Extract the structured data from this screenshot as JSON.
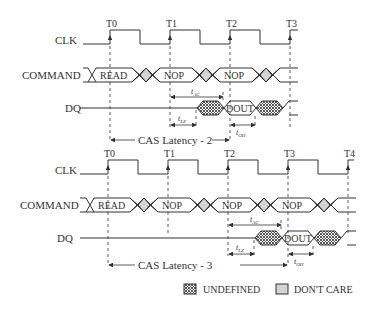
{
  "signals": {
    "clk": "CLK",
    "command": "COMMAND",
    "dq": "DQ"
  },
  "top": {
    "ticks": [
      "T0",
      "T1",
      "T2",
      "T3"
    ],
    "commands": [
      "READ",
      "NOP",
      "NOP"
    ],
    "dout": "DOUT",
    "cas_label": "CAS Latency - 2",
    "t_ac": "t",
    "t_ac_sub": "AC",
    "t_lz": "t",
    "t_lz_sub": "LZ",
    "t_oh": "t",
    "t_oh_sub": "OH"
  },
  "bottom": {
    "ticks": [
      "T0",
      "T1",
      "T2",
      "T3",
      "T4"
    ],
    "commands": [
      "READ",
      "NOP",
      "NOP",
      "NOP"
    ],
    "dout": "DOUT",
    "cas_label": "CAS Latency - 3",
    "t_ac": "t",
    "t_ac_sub": "AC",
    "t_lz": "t",
    "t_lz_sub": "LZ",
    "t_oh": "t",
    "t_oh_sub": "OH"
  },
  "legend": {
    "undefined": "UNDEFINED",
    "dont_care": "DON'T CARE"
  },
  "colors": {
    "line": "#333333",
    "dont_care_fill": "#d4d4d4",
    "undefined_pattern": "#555555"
  }
}
